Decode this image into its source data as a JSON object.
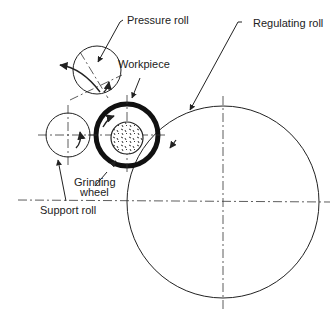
{
  "diagram": {
    "labels": {
      "pressure_roll": "Pressure roll",
      "workpiece": "Workpiece",
      "regulating_roll": "Regulating roll",
      "grinding_wheel_line1": "Grinding",
      "grinding_wheel_line2": "wheel",
      "support_roll": "Support roll"
    },
    "components": [
      {
        "name": "pressure-roll",
        "cx": 97,
        "cy": 70,
        "r": 24
      },
      {
        "name": "support-roll",
        "cx": 68,
        "cy": 135,
        "r": 22
      },
      {
        "name": "workpiece",
        "cx": 127,
        "cy": 135,
        "r": 33
      },
      {
        "name": "grinding-wheel",
        "cx": 127,
        "cy": 137,
        "r": 16
      },
      {
        "name": "regulating-roll",
        "cx": 223,
        "cy": 202,
        "r": 96
      }
    ],
    "colors": {
      "line": "#222222",
      "background": "#ffffff"
    }
  }
}
